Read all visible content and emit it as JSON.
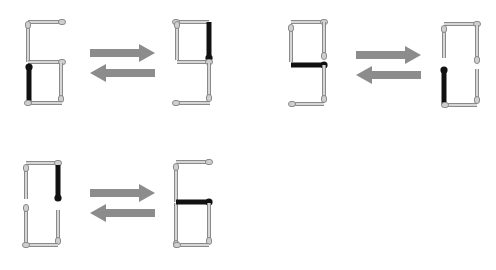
{
  "colors": {
    "background": "#ffffff",
    "match_body": "#d6d6d6",
    "match_outline": "#8a8a8a",
    "match_head": "#cfcfcf",
    "moved_match": "#111111",
    "arrow": "#8c8c8c"
  },
  "pairs": [
    {
      "from_digit": "6",
      "to_digit": "9",
      "arrows": {
        "x1": 90,
        "x2": 155,
        "y_right": 53,
        "y_left": 73
      }
    },
    {
      "from_digit": "9",
      "to_digit": "0",
      "arrows": {
        "x1": 356,
        "x2": 421,
        "y_right": 55,
        "y_left": 75
      }
    },
    {
      "from_digit": "0",
      "to_digit": "6",
      "arrows": {
        "x1": 90,
        "x2": 155,
        "y_right": 193,
        "y_left": 213
      }
    }
  ],
  "digits": [
    {
      "label": "6",
      "matches": [
        {
          "x1": 28,
          "y1": 22,
          "x2": 62,
          "y2": 22,
          "head": "end",
          "moved": false
        },
        {
          "x1": 28,
          "y1": 62,
          "x2": 28,
          "y2": 25,
          "head": "end",
          "moved": false
        },
        {
          "x1": 28,
          "y1": 62,
          "x2": 62,
          "y2": 62,
          "head": "end",
          "moved": false
        },
        {
          "x1": 29,
          "y1": 103,
          "x2": 29,
          "y2": 67,
          "head": "end",
          "moved": true
        },
        {
          "x1": 61,
          "y1": 63,
          "x2": 61,
          "y2": 99,
          "head": "end",
          "moved": false
        },
        {
          "x1": 62,
          "y1": 103,
          "x2": 28,
          "y2": 103,
          "head": "end",
          "moved": false
        }
      ]
    },
    {
      "label": "9",
      "matches": [
        {
          "x1": 209,
          "y1": 22,
          "x2": 176,
          "y2": 22,
          "head": "end",
          "moved": false
        },
        {
          "x1": 177,
          "y1": 60,
          "x2": 177,
          "y2": 25,
          "head": "end",
          "moved": false
        },
        {
          "x1": 209,
          "y1": 22,
          "x2": 209,
          "y2": 58,
          "head": "end",
          "moved": true
        },
        {
          "x1": 177,
          "y1": 62,
          "x2": 209,
          "y2": 62,
          "head": "end",
          "moved": false
        },
        {
          "x1": 209,
          "y1": 63,
          "x2": 209,
          "y2": 98,
          "head": "end",
          "moved": false
        },
        {
          "x1": 210,
          "y1": 103,
          "x2": 176,
          "y2": 103,
          "head": "end",
          "moved": false
        }
      ]
    },
    {
      "label": "9",
      "matches": [
        {
          "x1": 291,
          "y1": 22,
          "x2": 324,
          "y2": 22,
          "head": "end",
          "moved": false
        },
        {
          "x1": 291,
          "y1": 62,
          "x2": 291,
          "y2": 28,
          "head": "end",
          "moved": false
        },
        {
          "x1": 324,
          "y1": 22,
          "x2": 324,
          "y2": 56,
          "head": "end",
          "moved": false
        },
        {
          "x1": 291,
          "y1": 65,
          "x2": 324,
          "y2": 65,
          "head": "end",
          "moved": true
        },
        {
          "x1": 324,
          "y1": 65,
          "x2": 324,
          "y2": 99,
          "head": "end",
          "moved": false
        },
        {
          "x1": 324,
          "y1": 104,
          "x2": 292,
          "y2": 104,
          "head": "end",
          "moved": false
        }
      ]
    },
    {
      "label": "0",
      "matches": [
        {
          "x1": 444,
          "y1": 24,
          "x2": 477,
          "y2": 24,
          "head": "end",
          "moved": false
        },
        {
          "x1": 444,
          "y1": 58,
          "x2": 444,
          "y2": 29,
          "head": "end",
          "moved": false
        },
        {
          "x1": 477,
          "y1": 25,
          "x2": 477,
          "y2": 60,
          "head": "end",
          "moved": false
        },
        {
          "x1": 444,
          "y1": 104,
          "x2": 444,
          "y2": 70,
          "head": "end",
          "moved": true
        },
        {
          "x1": 477,
          "y1": 69,
          "x2": 477,
          "y2": 100,
          "head": "end",
          "moved": false
        },
        {
          "x1": 445,
          "y1": 105,
          "x2": 477,
          "y2": 105,
          "head": "start",
          "moved": false
        }
      ]
    },
    {
      "label": "0",
      "matches": [
        {
          "x1": 26,
          "y1": 163,
          "x2": 58,
          "y2": 163,
          "head": "end",
          "moved": false
        },
        {
          "x1": 26,
          "y1": 199,
          "x2": 26,
          "y2": 168,
          "head": "end",
          "moved": false
        },
        {
          "x1": 58,
          "y1": 165,
          "x2": 58,
          "y2": 198,
          "head": "end",
          "moved": true
        },
        {
          "x1": 26,
          "y1": 244,
          "x2": 26,
          "y2": 208,
          "head": "end",
          "moved": false
        },
        {
          "x1": 58,
          "y1": 210,
          "x2": 58,
          "y2": 241,
          "head": "end",
          "moved": false
        },
        {
          "x1": 26,
          "y1": 245,
          "x2": 58,
          "y2": 245,
          "head": "start",
          "moved": false
        }
      ]
    },
    {
      "label": "6",
      "matches": [
        {
          "x1": 176,
          "y1": 162,
          "x2": 209,
          "y2": 162,
          "head": "end",
          "moved": false
        },
        {
          "x1": 176,
          "y1": 202,
          "x2": 176,
          "y2": 167,
          "head": "end",
          "moved": false
        },
        {
          "x1": 176,
          "y1": 203,
          "x2": 176,
          "y2": 244,
          "head": "end",
          "moved": false
        },
        {
          "x1": 176,
          "y1": 202,
          "x2": 209,
          "y2": 202,
          "head": "end",
          "moved": true
        },
        {
          "x1": 209,
          "y1": 203,
          "x2": 209,
          "y2": 241,
          "head": "end",
          "moved": false
        },
        {
          "x1": 209,
          "y1": 245,
          "x2": 177,
          "y2": 245,
          "head": "end",
          "moved": false
        }
      ]
    }
  ]
}
